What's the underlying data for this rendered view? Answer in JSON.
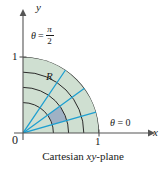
{
  "figure": {
    "caption_prefix": "Cartesian ",
    "caption_italic": "xy",
    "caption_suffix": "-plane",
    "caption_full": "Cartesian xy-plane"
  },
  "axes": {
    "x_label": "x",
    "y_label": "y",
    "origin_label": "0",
    "x_tick_label": "1",
    "y_tick_label": "1",
    "x_tick_value": 1,
    "y_tick_value": 1,
    "x_arrow_icon": "arrow-right-icon",
    "y_arrow_icon": "arrow-up-icon"
  },
  "labels": {
    "region": "R",
    "theta_zero_symbol": "θ",
    "theta_zero_eq": " = 0",
    "theta_zero_full": "θ = 0",
    "theta_halfpi_symbol": "θ",
    "theta_halfpi_eq": "=",
    "theta_halfpi_numerator": "π",
    "theta_halfpi_denominator": "2",
    "theta_halfpi_full": "θ = π/2"
  },
  "colors": {
    "region_fill": "#cfdfd1",
    "cell_fill": "#9fb1c4",
    "ray_stroke": "#1f9fd0",
    "arc_stroke": "#2a2a2a",
    "axis_stroke": "#555555",
    "text": "#1a1a1a",
    "background": "#ffffff"
  },
  "chart_data": {
    "type": "scatter",
    "title": "Cartesian xy-plane",
    "xlabel": "x",
    "ylabel": "y",
    "xlim": [
      0,
      1.25
    ],
    "ylim": [
      0,
      1.25
    ],
    "grid": false,
    "legend": "none",
    "region": {
      "name": "R",
      "r_range": [
        0,
        1
      ],
      "theta_range_deg": [
        0,
        90
      ],
      "theta_range_label": [
        "θ = 0",
        "θ = π/2"
      ]
    },
    "arcs_radii": [
      0.4,
      0.6,
      0.8,
      1.0
    ],
    "rays_theta_deg": [
      0,
      16,
      36,
      56,
      90
    ],
    "highlighted_cell": {
      "r_range": [
        0.4,
        0.6
      ],
      "theta_range_deg": [
        16,
        36
      ]
    },
    "annotations": [
      {
        "text": "R",
        "x": 0.32,
        "y": 0.74
      },
      {
        "text": "θ = π/2",
        "x": 0.12,
        "y": 1.32
      },
      {
        "text": "θ = 0",
        "x": 1.16,
        "y": 0.18
      }
    ],
    "xticks": [
      0,
      1
    ],
    "xticklabels": [
      "0",
      "1"
    ],
    "yticks": [
      0,
      1
    ],
    "yticklabels": [
      "0",
      "1"
    ]
  }
}
